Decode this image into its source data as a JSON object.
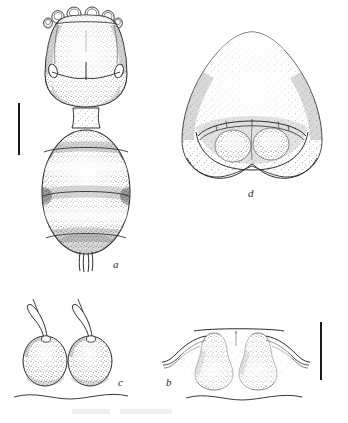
{
  "plate": {
    "type": "scientific-line-drawing",
    "technique": "stipple-and-line ink drawing",
    "background_color": "#ffffff",
    "ink_color": "#2b2b2b",
    "width": 348,
    "height": 423
  },
  "figures": [
    {
      "id": "a",
      "label": "a",
      "label_x": 113,
      "label_y": 259,
      "subject": "dorsal habitus",
      "description": "Whole body in dorsal view: anterior gnathosoma with four rounded apical lobes, propodosoma bearing paired lateral ocular ovals and a V-shaped suture with median line, followed by an ovoid opisthosoma crossed by three transverse segmental bands and terminating in a pair of short caudal setae.",
      "orientation": "dorsal",
      "center_x": 86,
      "center_y": 135
    },
    {
      "id": "b",
      "label": "b",
      "label_x": 166,
      "label_y": 377,
      "subject": "paired pyriform structures with lateral appendages",
      "description": "Two pear-shaped stippled bodies set beneath a straight transverse margin, each flanked by long curved tapering lateral appendages; a wavy contour line runs below.",
      "center_x": 229,
      "center_y": 358
    },
    {
      "id": "c",
      "label": "c",
      "label_x": 118,
      "label_y": 377,
      "subject": "paired ovoid bodies with flagelliform setae",
      "description": "Two ovoid stippled bodies, each bearing a long sinuous hooked seta arising from the apex and curving outward; a wavy contour line runs below.",
      "center_x": 72,
      "center_y": 355
    },
    {
      "id": "d",
      "label": "d",
      "label_x": 248,
      "label_y": 188,
      "subject": "genital / anal region, enlarged",
      "description": "Broad dome-shaped stippled plate with rounded shoulders, bearing an arched transverse ridge enclosing two rounded lobes; ventral margin gently bilobed.",
      "center_x": 252,
      "center_y": 105
    }
  ],
  "scale_bars": [
    {
      "id": "scale-bar-a",
      "belongs_to_figure": "a",
      "orientation": "vertical",
      "x": 18,
      "y": 103,
      "length_px": 52,
      "thickness_px": 2,
      "color": "#1a1a1a"
    },
    {
      "id": "scale-bar-b",
      "belongs_to_figure": "b",
      "orientation": "vertical",
      "x": 320,
      "y": 322,
      "length_px": 58,
      "thickness_px": 2,
      "color": "#1a1a1a"
    }
  ],
  "artifacts": [
    {
      "id": "scan-smudge",
      "description": "faint illegible scanning smudge along bottom margin",
      "x": 70,
      "y": 408,
      "width": 105,
      "height": 10
    }
  ]
}
